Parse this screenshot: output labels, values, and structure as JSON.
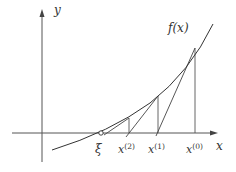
{
  "diagram": {
    "colors": {
      "axis": "#555555",
      "curve": "#333333",
      "line": "#444444",
      "background": "#ffffff"
    },
    "axes": {
      "y_label": "y",
      "x_label": "x",
      "x_axis": {
        "x1": 12,
        "x2": 217,
        "y": 133
      },
      "y_axis": {
        "x": 42,
        "y1": 162,
        "y2": 10
      }
    },
    "curve": {
      "label": "f(x)",
      "path": "M 52 150 Q 110 132 150 103 Q 190 72 213 24"
    },
    "points": [
      {
        "name": "xi",
        "label": "ξ",
        "x": 101,
        "curve_y": 133
      },
      {
        "name": "x2",
        "label": "x",
        "sup": "(2)",
        "x": 129,
        "curve_y": 118
      },
      {
        "name": "x1",
        "label": "x",
        "sup": "(1)",
        "x": 158,
        "curve_y": 96
      },
      {
        "name": "x0",
        "label": "x",
        "sup": "(0)",
        "x": 195,
        "curve_y": 48
      }
    ],
    "tangents": [
      {
        "from": "x0",
        "x1": 195,
        "y1": 48,
        "x2": 158,
        "y2": 133
      },
      {
        "from": "x1",
        "x1": 158,
        "y1": 96,
        "x2": 129,
        "y2": 133
      },
      {
        "from": "x2",
        "x1": 129,
        "y1": 118,
        "x2": 107,
        "y2": 133
      }
    ]
  }
}
